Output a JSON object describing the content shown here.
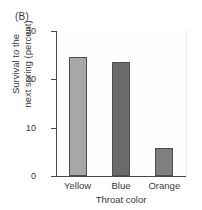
{
  "panel": {
    "label": "(B)"
  },
  "chart_data": {
    "type": "bar",
    "title": "(B)",
    "categories": [
      "Yellow",
      "Blue",
      "Orange"
    ],
    "values": [
      24.6,
      23.5,
      5.8
    ],
    "xlabel": "Throat color",
    "ylabel": "Survival to the next spring (percent)",
    "ylabel_lines": [
      "Survival to the",
      "next spring (percent)"
    ],
    "ylim": [
      0,
      30
    ],
    "yticks": [
      0,
      10,
      20,
      30
    ],
    "ytick_labels": [
      "0",
      "10",
      "20",
      "30"
    ],
    "grid": false,
    "legend": null,
    "bar_colors": [
      "#a8a8a8",
      "#6b6b6b",
      "#808080"
    ],
    "bar_edge_color": "#4d4d4d",
    "axis_color": "#4a4a4a"
  }
}
